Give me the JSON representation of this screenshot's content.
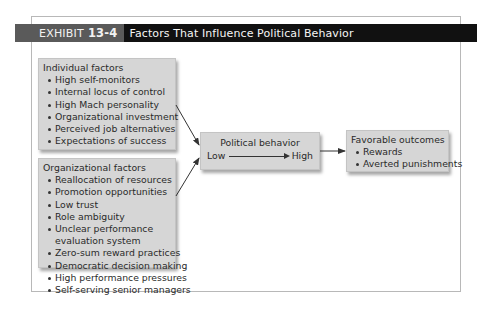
{
  "exhibit": {
    "tag": "EXHIBIT",
    "number": "13-4",
    "title": "Factors That Influence Political Behavior"
  },
  "individual_factors": {
    "heading": "Individual factors",
    "items": [
      "High self-monitors",
      "Internal locus of control",
      "High Mach personality",
      "Organizational investment",
      "Perceived job alternatives",
      "Expectations of success"
    ]
  },
  "organizational_factors": {
    "heading": "Organizational factors",
    "items": [
      "Reallocation of resources",
      "Promotion opportunities",
      "Low trust",
      "Role ambiguity",
      "Unclear performance evaluation system",
      "Zero-sum reward practices",
      "Democratic decision making",
      "High performance pressures",
      "Self-serving senior managers"
    ]
  },
  "political_behavior": {
    "heading": "Political behavior",
    "low_label": "Low",
    "high_label": "High"
  },
  "outcomes": {
    "heading": "Favorable outcomes",
    "items": [
      "Rewards",
      "Averted punishments"
    ]
  },
  "colors": {
    "title_bar": "#111111",
    "title_tag": "#5a5a5a",
    "box_fill": "#d6d6d6",
    "frame_border": "#b8b8b8"
  }
}
